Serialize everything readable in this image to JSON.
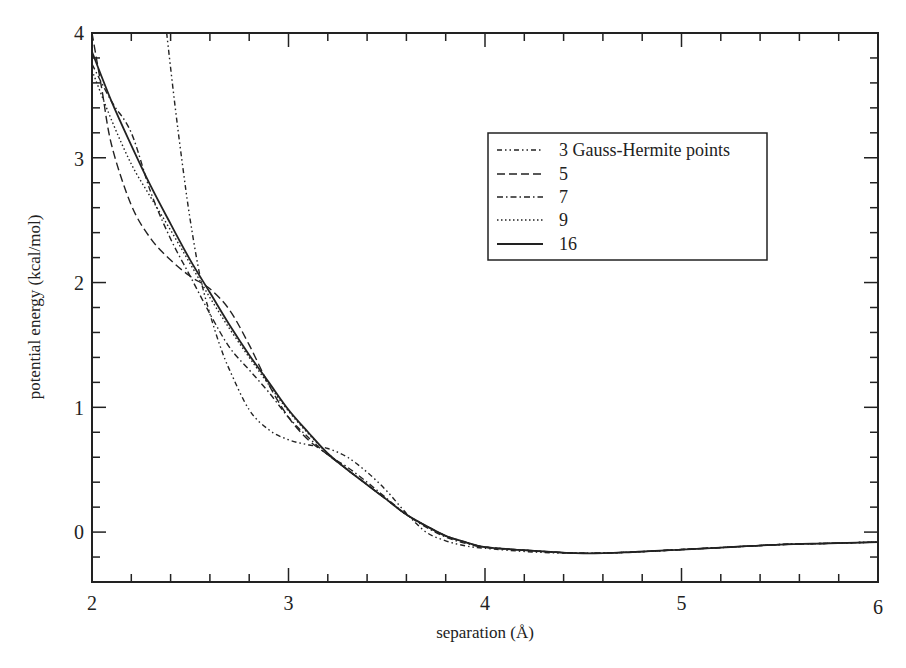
{
  "chart_data": {
    "type": "line",
    "title": "",
    "xlabel": "separation (Å)",
    "ylabel": "potential energy (kcal/mol)",
    "xlim": [
      2,
      6
    ],
    "ylim": [
      -0.4,
      4
    ],
    "x_ticks": [
      2,
      3,
      4,
      5,
      6
    ],
    "y_ticks": [
      0,
      1,
      2,
      3,
      4
    ],
    "grid": false,
    "legend_position": "upper right (inside)",
    "series": [
      {
        "name": "3 Gauss-Hermite points",
        "style": "dash-dot-dot",
        "x": [
          2.38,
          2.42,
          2.46,
          2.5,
          2.55,
          2.6,
          2.65,
          2.7,
          2.8,
          2.9,
          3.0,
          3.1,
          3.2,
          3.3,
          3.4,
          3.5,
          3.6,
          3.7,
          3.8,
          3.9,
          4.0,
          4.25,
          4.5,
          4.75,
          5.0,
          5.25,
          5.5,
          5.75,
          6.0
        ],
        "y": [
          4.0,
          3.45,
          2.95,
          2.5,
          2.05,
          1.75,
          1.5,
          1.3,
          0.98,
          0.82,
          0.74,
          0.7,
          0.67,
          0.6,
          0.48,
          0.33,
          0.15,
          0.0,
          -0.07,
          -0.11,
          -0.13,
          -0.16,
          -0.17,
          -0.16,
          -0.14,
          -0.12,
          -0.1,
          -0.09,
          -0.08
        ]
      },
      {
        "name": "5",
        "style": "dashed",
        "x": [
          2.0,
          2.05,
          2.1,
          2.2,
          2.3,
          2.4,
          2.5,
          2.6,
          2.7,
          2.8,
          2.9,
          3.0,
          3.1,
          3.2,
          3.3,
          3.4,
          3.5,
          3.6,
          3.7,
          3.8,
          3.9,
          4.0,
          4.25,
          4.5,
          4.75,
          5.0,
          5.25,
          5.5,
          5.75,
          6.0
        ],
        "y": [
          4.0,
          3.55,
          3.1,
          2.62,
          2.35,
          2.18,
          2.05,
          1.95,
          1.78,
          1.5,
          1.18,
          0.92,
          0.74,
          0.62,
          0.5,
          0.38,
          0.26,
          0.14,
          0.05,
          -0.03,
          -0.08,
          -0.12,
          -0.15,
          -0.17,
          -0.16,
          -0.14,
          -0.12,
          -0.1,
          -0.09,
          -0.08
        ]
      },
      {
        "name": "7",
        "style": "dash-dot",
        "x": [
          2.0,
          2.1,
          2.2,
          2.3,
          2.4,
          2.5,
          2.6,
          2.7,
          2.8,
          2.9,
          3.0,
          3.1,
          3.2,
          3.3,
          3.4,
          3.5,
          3.6,
          3.7,
          3.8,
          3.9,
          4.0,
          4.25,
          4.5,
          4.75,
          5.0,
          5.25,
          5.5,
          5.75,
          6.0
        ],
        "y": [
          3.75,
          3.45,
          3.2,
          2.72,
          2.35,
          2.05,
          1.75,
          1.48,
          1.3,
          1.12,
          0.92,
          0.76,
          0.62,
          0.52,
          0.4,
          0.27,
          0.14,
          0.04,
          -0.04,
          -0.09,
          -0.12,
          -0.15,
          -0.17,
          -0.16,
          -0.14,
          -0.12,
          -0.1,
          -0.09,
          -0.08
        ]
      },
      {
        "name": "9",
        "style": "dotted",
        "x": [
          2.0,
          2.1,
          2.2,
          2.3,
          2.4,
          2.5,
          2.6,
          2.7,
          2.8,
          2.9,
          3.0,
          3.1,
          3.2,
          3.3,
          3.4,
          3.5,
          3.6,
          3.7,
          3.8,
          3.9,
          4.0,
          4.25,
          4.5,
          4.75,
          5.0,
          5.25,
          5.5,
          5.75,
          6.0
        ],
        "y": [
          3.7,
          3.3,
          2.95,
          2.68,
          2.42,
          2.15,
          1.88,
          1.63,
          1.4,
          1.18,
          0.97,
          0.79,
          0.63,
          0.5,
          0.38,
          0.26,
          0.14,
          0.05,
          -0.03,
          -0.08,
          -0.12,
          -0.15,
          -0.17,
          -0.16,
          -0.14,
          -0.12,
          -0.1,
          -0.09,
          -0.08
        ]
      },
      {
        "name": "16",
        "style": "solid",
        "x": [
          2.0,
          2.1,
          2.2,
          2.3,
          2.4,
          2.5,
          2.6,
          2.7,
          2.8,
          2.9,
          3.0,
          3.1,
          3.2,
          3.3,
          3.4,
          3.5,
          3.6,
          3.7,
          3.8,
          3.9,
          4.0,
          4.25,
          4.5,
          4.75,
          5.0,
          5.25,
          5.5,
          5.75,
          6.0
        ],
        "y": [
          3.85,
          3.45,
          3.1,
          2.77,
          2.47,
          2.18,
          1.92,
          1.66,
          1.42,
          1.2,
          0.98,
          0.8,
          0.63,
          0.5,
          0.38,
          0.26,
          0.14,
          0.05,
          -0.03,
          -0.08,
          -0.12,
          -0.15,
          -0.17,
          -0.16,
          -0.14,
          -0.12,
          -0.1,
          -0.09,
          -0.08
        ]
      }
    ]
  },
  "axes": {
    "x_label": "separation (Å)",
    "y_label": "potential energy (kcal/mol)",
    "x_tick_labels": [
      "2",
      "3",
      "4",
      "5",
      "6"
    ],
    "y_tick_labels": [
      "0",
      "1",
      "2",
      "3",
      "4"
    ]
  },
  "legend": {
    "items": [
      {
        "label": "3 Gauss-Hermite points",
        "style": "dash-dot-dot"
      },
      {
        "label": "5",
        "style": "dashed"
      },
      {
        "label": "7",
        "style": "dash-dot"
      },
      {
        "label": "9",
        "style": "dotted"
      },
      {
        "label": "16",
        "style": "solid"
      }
    ]
  },
  "colors": {
    "ink": "#222222",
    "background": "#ffffff"
  }
}
